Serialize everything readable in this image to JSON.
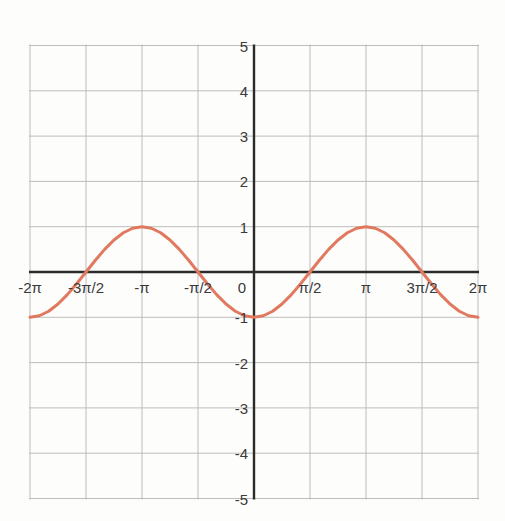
{
  "chart_data": {
    "type": "line",
    "title": "",
    "subtitle": "",
    "xlabel": "",
    "ylabel": "",
    "function": "y = -cos(x)",
    "xlim": [
      -6.283185307179586,
      6.283185307179586
    ],
    "ylim": [
      -5,
      5
    ],
    "grid": true,
    "legend": null,
    "legend_position": "none",
    "line_color": "#e1795f",
    "grid_color": "#bdbdbd",
    "axis_color": "#2b2b2b",
    "background_color": "#fdfdfc",
    "x_ticks": [
      {
        "value": -6.283185307179586,
        "label": "-2π"
      },
      {
        "value": -4.71238898038469,
        "label": "-3π/2"
      },
      {
        "value": -3.141592653589793,
        "label": "-π"
      },
      {
        "value": -1.5707963267948966,
        "label": "-π/2"
      },
      {
        "value": 0,
        "label": "0"
      },
      {
        "value": 1.5707963267948966,
        "label": "π/2"
      },
      {
        "value": 3.141592653589793,
        "label": "π"
      },
      {
        "value": 4.71238898038469,
        "label": "3π/2"
      },
      {
        "value": 6.283185307179586,
        "label": "2π"
      }
    ],
    "y_ticks": [
      {
        "value": 5,
        "label": "5"
      },
      {
        "value": 4,
        "label": "4"
      },
      {
        "value": 3,
        "label": "3"
      },
      {
        "value": 2,
        "label": "2"
      },
      {
        "value": 1,
        "label": "1"
      },
      {
        "value": 0,
        "label": "0"
      },
      {
        "value": -1,
        "label": "-1"
      },
      {
        "value": -2,
        "label": "-2"
      },
      {
        "value": -3,
        "label": "-3"
      },
      {
        "value": -4,
        "label": "-4"
      },
      {
        "value": -5,
        "label": "-5"
      }
    ],
    "series": [
      {
        "name": "y = -cos(x)",
        "color": "#e1795f",
        "line_width": 3,
        "x": [
          -6.283185307179586,
          -6.021385919380436,
          -5.759586531581287,
          -5.497787143782138,
          -5.235987755982989,
          -4.97418836818384,
          -4.71238898038469,
          -4.450589592585541,
          -4.188790204786391,
          -3.9269908169872414,
          -3.665191429188092,
          -3.403392041388943,
          -3.141592653589793,
          -2.879793265790644,
          -2.617993877991494,
          -2.356194490192345,
          -2.0943951023931953,
          -1.832595714594046,
          -1.5707963267948966,
          -1.3089969389957472,
          -1.0471975511965976,
          -0.7853981633974483,
          -0.5235987755982988,
          -0.2617993877991494,
          0,
          0.2617993877991494,
          0.5235987755982988,
          0.7853981633974483,
          1.0471975511965976,
          1.3089969389957472,
          1.5707963267948966,
          1.832595714594046,
          2.0943951023931953,
          2.356194490192345,
          2.617993877991494,
          2.879793265790644,
          3.141592653589793,
          3.403392041388943,
          3.665191429188092,
          3.9269908169872414,
          4.188790204786391,
          4.450589592585541,
          4.71238898038469,
          4.97418836818384,
          5.235987755982989,
          5.497787143782138,
          5.759586531581287,
          6.021385919380436,
          6.283185307179586
        ],
        "y": [
          -1,
          -0.9659258262890683,
          -0.8660254037844387,
          -0.7071067811865476,
          -0.5,
          -0.25881904510252074,
          0,
          0.25881904510252074,
          0.5,
          0.7071067811865476,
          0.8660254037844387,
          0.9659258262890683,
          1,
          0.9659258262890683,
          0.8660254037844387,
          0.7071067811865476,
          0.5,
          0.25881904510252074,
          0,
          -0.25881904510252074,
          -0.5,
          -0.7071067811865476,
          -0.8660254037844387,
          -0.9659258262890683,
          -1,
          -0.9659258262890683,
          -0.8660254037844387,
          -0.7071067811865476,
          -0.5,
          -0.25881904510252074,
          0,
          0.25881904510252074,
          0.5,
          0.7071067811865476,
          0.8660254037844387,
          0.9659258262890683,
          1,
          0.9659258262890683,
          0.8660254037844387,
          0.7071067811865476,
          0.5,
          0.25881904510252074,
          0,
          -0.25881904510252074,
          -0.5,
          -0.7071067811865476,
          -0.8660254037844387,
          -0.9659258262890683,
          -1
        ]
      }
    ],
    "annotations": []
  }
}
